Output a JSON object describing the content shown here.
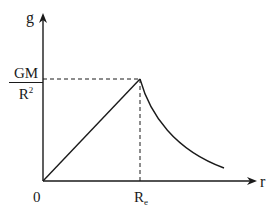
{
  "diagram": {
    "y_axis_label": "g",
    "x_axis_label": "r",
    "origin_label": "0",
    "y_marker": {
      "numerator": "GM",
      "denominator": "R",
      "denominator_sup": "2"
    },
    "x_marker": {
      "base": "R",
      "sub": "e"
    },
    "segments": [
      {
        "name": "inside-earth",
        "shape": "linear",
        "from": "0",
        "to": "R_e",
        "description": "g increases linearly from 0 to GM/R^2"
      },
      {
        "name": "outside-earth",
        "shape": "inverse-square",
        "from": "R_e",
        "description": "g decreases as 1/r^2 beyond R_e"
      }
    ],
    "colors": {
      "line": "#1a1a1a",
      "background": "#ffffff"
    }
  }
}
